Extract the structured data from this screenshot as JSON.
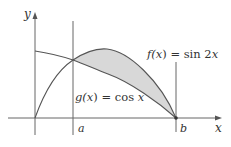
{
  "diagram": {
    "type": "area-between-curves",
    "axes": {
      "x_label": "x",
      "y_label": "y"
    },
    "curves": [
      {
        "name": "f",
        "label": "f(x) = sin 2x",
        "func": "x",
        "expr": "sin 2x"
      },
      {
        "name": "g",
        "label": "g(x) = cos x",
        "func": "x",
        "expr": "cos x"
      }
    ],
    "bounds": {
      "a_label": "a",
      "b_label": "b"
    },
    "labels": {
      "f_label_left": "f(",
      "f_label_var": "x",
      "f_label_right": ") = sin 2",
      "f_label_end": "x",
      "g_label_left": "g(",
      "g_label_var": "x",
      "g_label_right": ") = cos ",
      "g_label_end": "x"
    },
    "colors": {
      "stroke": "#555555",
      "shade": "#d8d8d8",
      "axis": "#666666"
    }
  }
}
